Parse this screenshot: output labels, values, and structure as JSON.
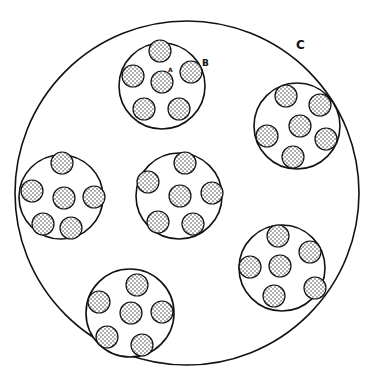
{
  "diagram": {
    "colors": {
      "stroke": "#111111",
      "fill": "#ffffff",
      "stipple": "#222222"
    },
    "labels": {
      "A": {
        "text": "A",
        "x": 168,
        "y": 66
      },
      "B": {
        "text": "B",
        "x": 202,
        "y": 58
      },
      "C": {
        "text": "C",
        "x": 296,
        "y": 38
      }
    },
    "outer": {
      "name": "C",
      "cx": 187,
      "cy": 193,
      "r": 172
    },
    "groups": [
      {
        "name": "B",
        "cx": 162,
        "cy": 86,
        "r": 43,
        "smalls": [
          [
            160,
            51
          ],
          [
            133,
            76
          ],
          [
            162,
            82
          ],
          [
            191,
            72
          ],
          [
            144,
            109
          ],
          [
            179,
            109
          ]
        ]
      },
      {
        "name": "right",
        "cx": 297,
        "cy": 126,
        "r": 43,
        "smalls": [
          [
            286,
            96
          ],
          [
            320,
            105
          ],
          [
            300,
            126
          ],
          [
            267,
            136
          ],
          [
            326,
            139
          ],
          [
            293,
            157
          ]
        ]
      },
      {
        "name": "left",
        "cx": 61,
        "cy": 197,
        "r": 42,
        "smalls": [
          [
            62,
            163
          ],
          [
            32,
            191
          ],
          [
            64,
            198
          ],
          [
            94,
            197
          ],
          [
            43,
            224
          ],
          [
            71,
            228
          ]
        ]
      },
      {
        "name": "center",
        "cx": 179,
        "cy": 196,
        "r": 43,
        "smalls": [
          [
            185,
            163
          ],
          [
            148,
            182
          ],
          [
            180,
            196
          ],
          [
            212,
            193
          ],
          [
            158,
            222
          ],
          [
            193,
            224
          ]
        ]
      },
      {
        "name": "lower-right",
        "cx": 282,
        "cy": 268,
        "r": 43,
        "smalls": [
          [
            278,
            236
          ],
          [
            310,
            252
          ],
          [
            250,
            267
          ],
          [
            280,
            266
          ],
          [
            315,
            288
          ],
          [
            274,
            296
          ]
        ]
      },
      {
        "name": "bottom",
        "cx": 130,
        "cy": 313,
        "r": 44,
        "smalls": [
          [
            137,
            285
          ],
          [
            99,
            302
          ],
          [
            131,
            313
          ],
          [
            162,
            312
          ],
          [
            107,
            337
          ],
          [
            142,
            345
          ]
        ]
      }
    ],
    "small_radius": 11
  }
}
